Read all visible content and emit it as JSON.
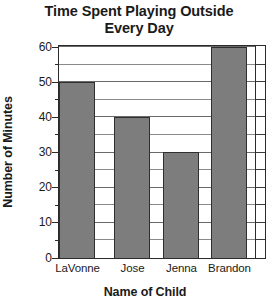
{
  "chart_data": {
    "type": "bar",
    "title": "Time Spent Playing Outside\nEvery Day",
    "title_line1": "Time Spent Playing Outside",
    "title_line2": "Every Day",
    "xlabel": "Name of Child",
    "ylabel": "Number of Minutes",
    "categories": [
      "LaVonne",
      "Jose",
      "Jenna",
      "Brandon"
    ],
    "values": [
      50,
      40,
      30,
      60
    ],
    "ylim": [
      0,
      60
    ],
    "ytick_labels": [
      "0",
      "10",
      "20",
      "30",
      "40",
      "50",
      "60"
    ],
    "ytick_values": [
      0,
      10,
      20,
      30,
      40,
      50,
      60
    ],
    "minor_tick_step": 5,
    "grid": "horizontal-minor-and-major",
    "legend": "none",
    "bar_color": "#7d7d7d",
    "bar_edge_color": "#2f2f2f",
    "axis_color": "#2b2b2b",
    "grid_color": "#8a8a8a",
    "background_color": "#ffffff"
  }
}
